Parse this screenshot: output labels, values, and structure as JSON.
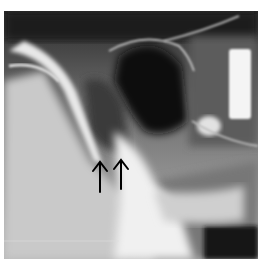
{
  "image": {
    "type": "radiograph",
    "description": "Lateral skull/facial X-ray showing sinus region with two black upward-pointing arrows",
    "annotations": [
      {
        "kind": "arrow",
        "direction": "up",
        "label": ""
      },
      {
        "kind": "arrow",
        "direction": "up",
        "label": ""
      }
    ]
  }
}
